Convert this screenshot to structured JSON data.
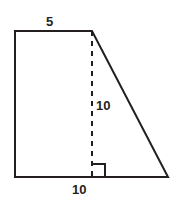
{
  "figure": {
    "name": "right-trapezoid-with-altitude",
    "background_color": "#ffffff",
    "stroke_color": "#231f20",
    "stroke_width": 2,
    "labels": {
      "top_side": "5",
      "height": "10",
      "base": "10"
    },
    "marks": {
      "right_angle_marker": "right-angle-square",
      "altitude_style": "dashed"
    },
    "geometry": {
      "vertices": {
        "top_left": [
          15,
          31
        ],
        "top_right": [
          92,
          31
        ],
        "bottom_right": [
          168,
          177
        ],
        "bottom_left": [
          15,
          177
        ]
      },
      "altitude": {
        "from": [
          92,
          31
        ],
        "to": [
          92,
          177
        ]
      },
      "right_angle_square": {
        "x": 92,
        "y": 164,
        "size": 13
      }
    }
  }
}
